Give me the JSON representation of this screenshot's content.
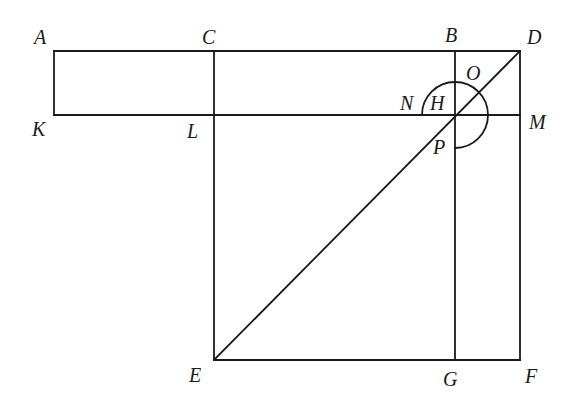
{
  "diagram": {
    "type": "geometric-figure",
    "points": {
      "A": {
        "label": "A",
        "x": 54,
        "y": 51
      },
      "C": {
        "label": "C",
        "x": 214,
        "y": 51
      },
      "B": {
        "label": "B",
        "x": 455,
        "y": 51
      },
      "D": {
        "label": "D",
        "x": 520,
        "y": 51
      },
      "K": {
        "label": "K",
        "x": 54,
        "y": 115
      },
      "L": {
        "label": "L",
        "x": 214,
        "y": 115
      },
      "H": {
        "label": "H",
        "x": 455,
        "y": 115
      },
      "M": {
        "label": "M",
        "x": 520,
        "y": 115
      },
      "E": {
        "label": "E",
        "x": 214,
        "y": 360
      },
      "G": {
        "label": "G",
        "x": 455,
        "y": 360
      },
      "F": {
        "label": "F",
        "x": 520,
        "y": 360
      },
      "N": {
        "label": "N"
      },
      "O": {
        "label": "O"
      },
      "P": {
        "label": "P"
      }
    },
    "segments": [
      "AD",
      "KM",
      "EF",
      "AK",
      "CE",
      "BG",
      "DF",
      "ED"
    ],
    "arc": {
      "center": "H",
      "radius": 33,
      "from": "N",
      "through": "O",
      "to": "P"
    },
    "stroke_color": "#1a1a1a",
    "background": "#ffffff"
  }
}
